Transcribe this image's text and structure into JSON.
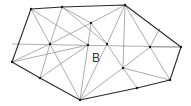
{
  "diagram": {
    "title": "",
    "type": "triangulation",
    "label": "B",
    "label_pos": [
      92,
      62
    ],
    "colors": {
      "hull": "#2a2a2a",
      "edge": "#8a8a8a",
      "point": "#1a1a1a",
      "background": "#ffffff"
    },
    "hull": [
      [
        31,
        9
      ],
      [
        62,
        7
      ],
      [
        125,
        5
      ],
      [
        181,
        47
      ],
      [
        170,
        80
      ],
      [
        137,
        88
      ],
      [
        80,
        100
      ],
      [
        40,
        78
      ],
      [
        12,
        62
      ]
    ],
    "interior_points": [
      [
        91,
        23
      ],
      [
        50,
        44
      ],
      [
        88,
        45
      ],
      [
        107,
        44
      ],
      [
        150,
        47
      ],
      [
        123,
        68
      ]
    ],
    "edges": [
      [
        [
          31,
          9
        ],
        [
          50,
          44
        ]
      ],
      [
        [
          62,
          7
        ],
        [
          50,
          44
        ]
      ],
      [
        [
          62,
          7
        ],
        [
          91,
          23
        ]
      ],
      [
        [
          125,
          5
        ],
        [
          91,
          23
        ]
      ],
      [
        [
          50,
          44
        ],
        [
          91,
          23
        ]
      ],
      [
        [
          91,
          23
        ],
        [
          107,
          44
        ]
      ],
      [
        [
          91,
          23
        ],
        [
          88,
          45
        ]
      ],
      [
        [
          125,
          5
        ],
        [
          107,
          44
        ]
      ],
      [
        [
          125,
          5
        ],
        [
          150,
          47
        ]
      ],
      [
        [
          125,
          5
        ],
        [
          123,
          68
        ]
      ],
      [
        [
          181,
          47
        ],
        [
          150,
          47
        ]
      ],
      [
        [
          160,
          28
        ],
        [
          150,
          47
        ]
      ],
      [
        [
          150,
          47
        ],
        [
          170,
          80
        ]
      ],
      [
        [
          150,
          47
        ],
        [
          123,
          68
        ]
      ],
      [
        [
          107,
          44
        ],
        [
          123,
          68
        ]
      ],
      [
        [
          123,
          68
        ],
        [
          137,
          88
        ]
      ],
      [
        [
          123,
          68
        ],
        [
          80,
          100
        ]
      ],
      [
        [
          123,
          68
        ],
        [
          170,
          80
        ]
      ],
      [
        [
          107,
          44
        ],
        [
          80,
          100
        ]
      ],
      [
        [
          88,
          45
        ],
        [
          80,
          100
        ]
      ],
      [
        [
          50,
          44
        ],
        [
          80,
          100
        ]
      ],
      [
        [
          50,
          44
        ],
        [
          40,
          78
        ]
      ],
      [
        [
          12,
          62
        ],
        [
          50,
          44
        ]
      ],
      [
        [
          12,
          62
        ],
        [
          88,
          45
        ]
      ],
      [
        [
          40,
          78
        ],
        [
          88,
          45
        ]
      ],
      [
        [
          12,
          44
        ],
        [
          181,
          47
        ]
      ],
      [
        [
          31,
          9
        ],
        [
          88,
          45
        ]
      ],
      [
        [
          62,
          7
        ],
        [
          107,
          44
        ]
      ]
    ]
  }
}
